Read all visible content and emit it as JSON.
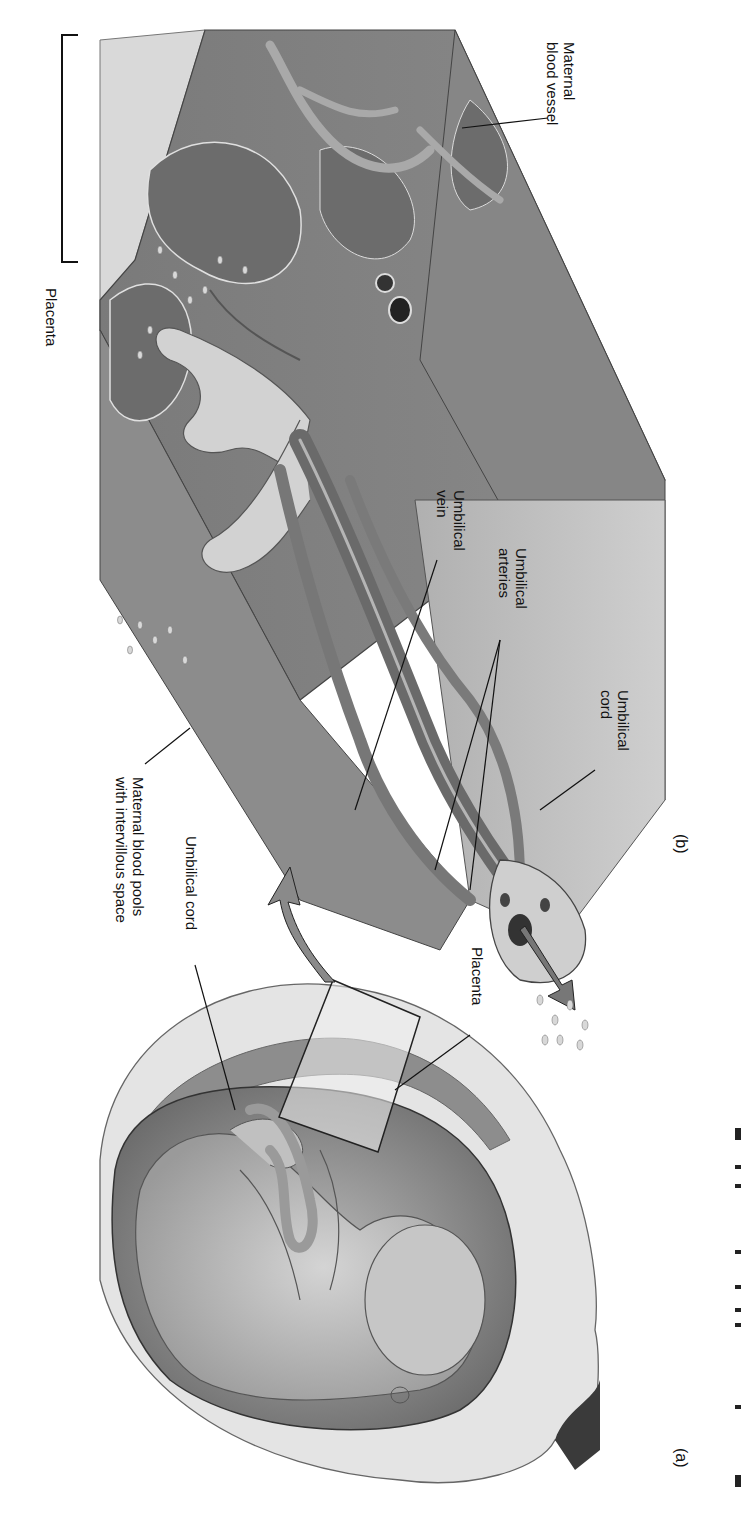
{
  "figure": {
    "panels": {
      "a": "(a)",
      "b": "(b)"
    },
    "labels_b": {
      "placenta_bracket": "Placenta",
      "maternal_blood_vessel": [
        "Maternal",
        "blood vessel"
      ],
      "umbilical_vein": [
        "Umbilical",
        "vein"
      ],
      "umbilical_arteries": [
        "Umbilical",
        "arteries"
      ],
      "umbilical_cord": [
        "Umbilical",
        "cord"
      ],
      "maternal_blood_pools": [
        "Maternal blood pools",
        "with intervillous space"
      ]
    },
    "labels_a": {
      "umbilical_cord": "Umbilical cord",
      "placenta": "Placenta"
    },
    "colors": {
      "tissue_dark": "#6e6e6e",
      "tissue_mid": "#8f8f8f",
      "tissue_light": "#c9c9c9",
      "skin": "#bdbdbd",
      "wall": "#dcdcdc"
    }
  }
}
